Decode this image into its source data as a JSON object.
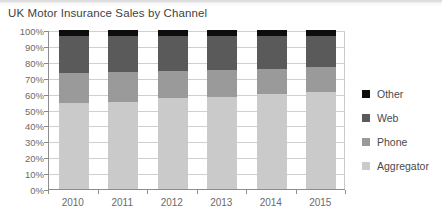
{
  "chart_data": {
    "type": "bar",
    "stacked": true,
    "normalized": true,
    "title": "UK Motor Insurance Sales by Channel",
    "xlabel": "",
    "ylabel": "",
    "categories": [
      "2010",
      "2011",
      "2012",
      "2013",
      "2014",
      "2015"
    ],
    "ylim": [
      0,
      100
    ],
    "yticks": [
      0,
      10,
      20,
      30,
      40,
      50,
      60,
      70,
      80,
      90,
      100
    ],
    "ytick_labels": [
      "0%",
      "10%",
      "20%",
      "30%",
      "40%",
      "50%",
      "60%",
      "70%",
      "80%",
      "90%",
      "100%"
    ],
    "grid": true,
    "legend_position": "right",
    "series": [
      {
        "name": "Other",
        "color": "#0d0d0d",
        "values": [
          4,
          4,
          4,
          4,
          4,
          4
        ]
      },
      {
        "name": "Web",
        "color": "#5a5a5a",
        "values": [
          23,
          22.5,
          21.5,
          21,
          20.5,
          19.5
        ]
      },
      {
        "name": "Phone",
        "color": "#9a9a9a",
        "values": [
          19,
          18.5,
          17.5,
          17,
          16,
          15.5
        ]
      },
      {
        "name": "Aggregator",
        "color": "#cacaca",
        "values": [
          54,
          55,
          57,
          58,
          59.5,
          61
        ]
      }
    ],
    "stack_order_bottom_to_top": [
      "Aggregator",
      "Phone",
      "Web",
      "Other"
    ]
  },
  "legend": {
    "items": [
      {
        "label": "Other",
        "color": "#0d0d0d"
      },
      {
        "label": "Web",
        "color": "#5a5a5a"
      },
      {
        "label": "Phone",
        "color": "#9a9a9a"
      },
      {
        "label": "Aggregator",
        "color": "#cacaca"
      }
    ]
  },
  "axes": {
    "y_labels": [
      "100%",
      "90%",
      "80%",
      "70%",
      "60%",
      "50%",
      "40%",
      "30%",
      "20%",
      "10%",
      "0%"
    ],
    "x_labels": [
      "2010",
      "2011",
      "2012",
      "2013",
      "2014",
      "2015"
    ]
  }
}
